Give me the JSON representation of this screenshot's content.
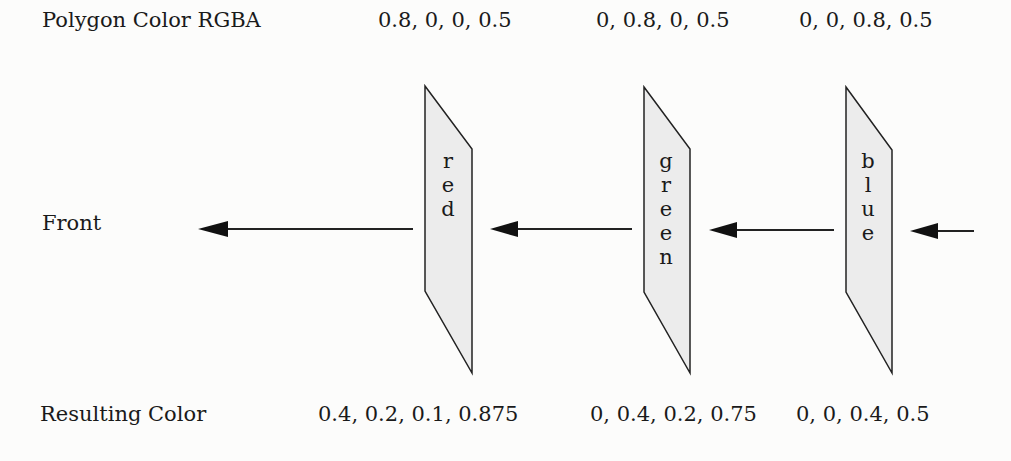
{
  "rows": {
    "top_label": "Polygon Color RGBA",
    "middle_label": "Front",
    "bottom_label": "Resulting Color"
  },
  "panels": [
    {
      "name": "red",
      "letters": [
        "r",
        "e",
        "d"
      ],
      "polygon_rgba": "0.8, 0, 0, 0.5",
      "result_rgba": "0.4, 0.2, 0.1, 0.875"
    },
    {
      "name": "green",
      "letters": [
        "g",
        "r",
        "e",
        "e",
        "n"
      ],
      "polygon_rgba": "0, 0.8, 0, 0.5",
      "result_rgba": "0, 0.4, 0.2, 0.75"
    },
    {
      "name": "blue",
      "letters": [
        "b",
        "l",
        "u",
        "e"
      ],
      "polygon_rgba": "0, 0, 0.8, 0.5",
      "result_rgba": "0, 0, 0.4, 0.5"
    }
  ],
  "colors": {
    "panel_fill": "#ececec",
    "stroke": "#222222"
  }
}
